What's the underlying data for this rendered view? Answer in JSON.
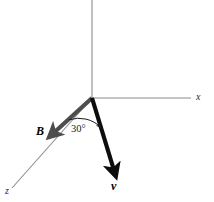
{
  "figure": {
    "background_color": "#ffffff",
    "width": 214,
    "height": 202
  },
  "axes": {
    "origin": {
      "x": 92,
      "y": 98
    },
    "items": [
      {
        "name": "x-axis",
        "label": "x",
        "color": "#8c8c8c",
        "stroke_width": 1.1,
        "from": {
          "x": 92,
          "y": 98
        },
        "to": {
          "x": 191,
          "y": 98
        },
        "label_pos": {
          "x": 196,
          "y": 92
        }
      },
      {
        "name": "y-axis",
        "label": "",
        "color": "#8c8c8c",
        "stroke_width": 1.1,
        "from": {
          "x": 92,
          "y": 98
        },
        "to": {
          "x": 92,
          "y": 0
        },
        "label_pos": null
      },
      {
        "name": "z-axis",
        "label": "z",
        "color": "#8c8c8c",
        "stroke_width": 1.1,
        "from": {
          "x": 92,
          "y": 98
        },
        "to": {
          "x": 12,
          "y": 188
        },
        "label_pos": {
          "x": 5,
          "y": 186
        }
      }
    ]
  },
  "vectors": [
    {
      "name": "magnetic-field-vector",
      "label": "B",
      "color": "#4d4d4d",
      "stroke_width": 4.2,
      "from": {
        "x": 92,
        "y": 98
      },
      "to": {
        "x": 49,
        "y": 137
      },
      "label_pos": {
        "x": 36,
        "y": 125
      },
      "description": "magnetic field vector along negative z direction"
    },
    {
      "name": "velocity-vector",
      "label": "v",
      "color": "#0d0d0d",
      "stroke_width": 4.2,
      "from": {
        "x": 92,
        "y": 98
      },
      "to": {
        "x": 116,
        "y": 177
      },
      "label_pos": {
        "x": 111,
        "y": 180
      },
      "description": "particle velocity vector"
    }
  ],
  "angle": {
    "name": "angle-between-vectors",
    "value": "30",
    "unit": "°",
    "text": "30°",
    "label_pos": {
      "x": 71,
      "y": 124
    },
    "arc": {
      "center": {
        "x": 92,
        "y": 98
      },
      "radius": 31,
      "color": "#1a1a1a",
      "stroke_width": 1.0
    }
  }
}
